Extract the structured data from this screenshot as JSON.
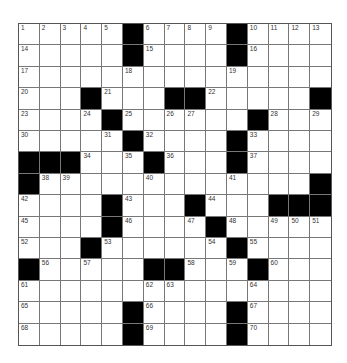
{
  "puzzle": {
    "rows": 15,
    "cols": 15,
    "colors": {
      "block": "#000000",
      "cell": "#ffffff",
      "grid_line": "#777777"
    },
    "grid": [
      [
        "1",
        "2",
        "3",
        "4",
        "5",
        "#",
        "6",
        "7",
        "8",
        "9",
        "#",
        "10",
        "11",
        "12",
        "13"
      ],
      [
        "14",
        "",
        "",
        "",
        "",
        "#",
        "15",
        "",
        "",
        "",
        "#",
        "16",
        "",
        "",
        ""
      ],
      [
        "17",
        "",
        "",
        "",
        "",
        "18",
        "",
        "",
        "",
        "",
        "19",
        "",
        "",
        "",
        ""
      ],
      [
        "20",
        "",
        "",
        "#",
        "21",
        "",
        "",
        "#",
        "#",
        "22",
        "",
        "",
        "",
        "",
        "#"
      ],
      [
        "23",
        "",
        "",
        "24",
        "#",
        "25",
        "",
        "26",
        "27",
        "",
        "",
        "#",
        "28",
        "",
        "29"
      ],
      [
        "30",
        "",
        "",
        "",
        "31",
        "#",
        "32",
        "",
        "",
        "",
        "#",
        "33",
        "",
        "",
        ""
      ],
      [
        "#",
        "#",
        "#",
        "34",
        "",
        "35",
        "#",
        "36",
        "",
        "",
        "#",
        "37",
        "",
        "",
        ""
      ],
      [
        "#",
        "38",
        "39",
        "",
        "",
        "",
        "40",
        "",
        "",
        "",
        "41",
        "",
        "",
        "",
        "#"
      ],
      [
        "42",
        "",
        "",
        "",
        "#",
        "43",
        "",
        "",
        "#",
        "44",
        "",
        "",
        "#",
        "#",
        "#"
      ],
      [
        "45",
        "",
        "",
        "",
        "#",
        "46",
        "",
        "",
        "47",
        "#",
        "48",
        "",
        "49",
        "50",
        "51"
      ],
      [
        "52",
        "",
        "",
        "#",
        "53",
        "",
        "",
        "",
        "",
        "54",
        "#",
        "55",
        "",
        "",
        ""
      ],
      [
        "#",
        "56",
        "",
        "57",
        "",
        "",
        "#",
        "#",
        "58",
        "",
        "59",
        "#",
        "60",
        "",
        ""
      ],
      [
        "61",
        "",
        "",
        "",
        "",
        "",
        "62",
        "63",
        "",
        "",
        "",
        "64",
        "",
        "",
        ""
      ],
      [
        "65",
        "",
        "",
        "",
        "",
        "#",
        "66",
        "",
        "",
        "",
        "#",
        "67",
        "",
        "",
        ""
      ],
      [
        "68",
        "",
        "",
        "",
        "",
        "#",
        "69",
        "",
        "",
        "",
        "#",
        "70",
        "",
        "",
        ""
      ]
    ]
  }
}
